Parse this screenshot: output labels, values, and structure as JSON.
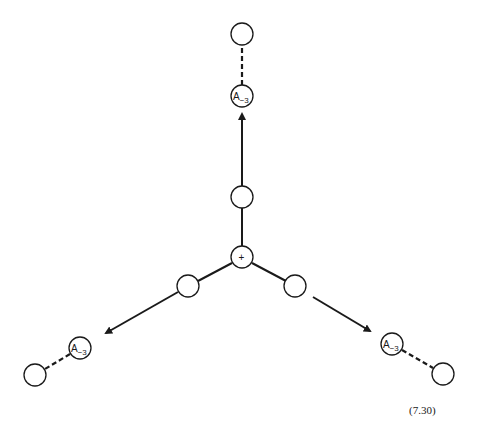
{
  "diagram": {
    "center_node": {
      "label": "+",
      "x": 242,
      "y": 257
    },
    "branches": [
      {
        "direction": "up",
        "inner_node": {
          "x": 242,
          "y": 197
        },
        "arrow_tip": {
          "x": 242,
          "y": 114
        },
        "labeled_node": {
          "label": "A",
          "subscript": "−3",
          "x": 242,
          "y": 96
        },
        "outer_node": {
          "x": 242,
          "y": 34
        }
      },
      {
        "direction": "down-left",
        "inner_node": {
          "x": 188,
          "y": 286
        },
        "arrow_tip": {
          "x": 106,
          "y": 333
        },
        "labeled_node": {
          "label": "A",
          "subscript": "−3",
          "x": 80,
          "y": 348
        },
        "outer_node": {
          "x": 35,
          "y": 375
        }
      },
      {
        "direction": "down-right",
        "inner_node": {
          "x": 295,
          "y": 286
        },
        "arrow_tip": {
          "x": 370,
          "y": 331
        },
        "labeled_node": {
          "label": "A",
          "subscript": "−3",
          "x": 392,
          "y": 344
        },
        "outer_node": {
          "x": 443,
          "y": 374
        }
      }
    ],
    "equation_number": "(7.30)"
  }
}
